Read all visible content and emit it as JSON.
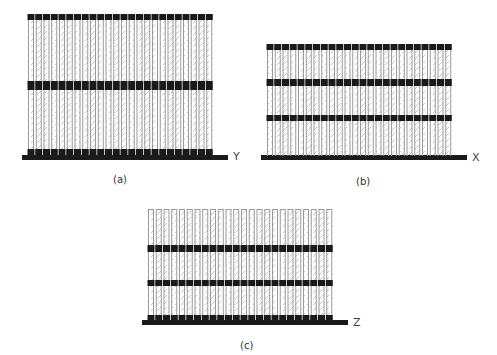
{
  "figure": {
    "panels": [
      {
        "id": "a",
        "caption": "(a)",
        "axis_label": "Y",
        "column_count": 24,
        "columns_x0": 28,
        "column_pitch": 7.75,
        "column_width": 6,
        "column_top": 14,
        "column_bottom": 156,
        "top_open": false,
        "bands": [
          {
            "y": 14,
            "h": 6
          },
          {
            "y": 81,
            "h": 9
          }
        ],
        "feet": {
          "y": 149,
          "h": 7
        },
        "base": {
          "x": 22,
          "y": 155,
          "w": 206,
          "h": 5
        },
        "label_pos": {
          "x": 233,
          "y": 150
        },
        "caption_pos": {
          "x": 113,
          "y": 174
        }
      },
      {
        "id": "b",
        "caption": "(b)",
        "axis_label": "X",
        "column_count": 24,
        "columns_x0": 267,
        "column_pitch": 7.75,
        "column_width": 6,
        "column_top": 44,
        "column_bottom": 156,
        "top_open": false,
        "bands": [
          {
            "y": 44,
            "h": 6
          },
          {
            "y": 79,
            "h": 7
          },
          {
            "y": 115,
            "h": 6
          }
        ],
        "feet": null,
        "base": {
          "x": 261,
          "y": 155,
          "w": 206,
          "h": 5
        },
        "label_pos": {
          "x": 472,
          "y": 151
        },
        "caption_pos": {
          "x": 356,
          "y": 176
        }
      },
      {
        "id": "c",
        "caption": "(c)",
        "axis_label": "Z",
        "column_count": 24,
        "columns_x0": 148,
        "column_pitch": 7.75,
        "column_width": 6,
        "column_top": 209,
        "column_bottom": 322,
        "top_open": true,
        "bands": [
          {
            "y": 245,
            "h": 7
          },
          {
            "y": 280,
            "h": 6
          }
        ],
        "feet": {
          "y": 315,
          "h": 7
        },
        "base": {
          "x": 142,
          "y": 320,
          "w": 206,
          "h": 5
        },
        "label_pos": {
          "x": 353,
          "y": 316
        },
        "caption_pos": {
          "x": 240,
          "y": 340
        }
      }
    ],
    "colors": {
      "band": "#1a1a1a",
      "base": "#1a1a1a",
      "column_outline": "#9a9a9a",
      "hatch": "#b5b5b5",
      "background": "#ffffff"
    }
  }
}
